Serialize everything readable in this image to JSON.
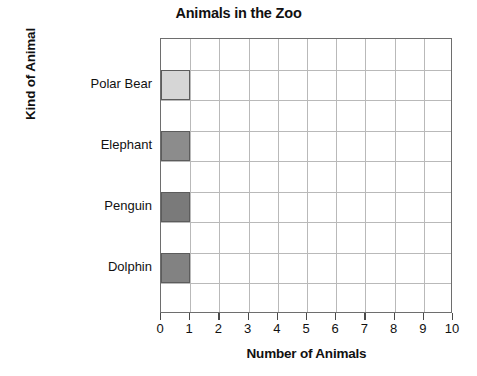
{
  "chart_data": {
    "type": "bar",
    "orientation": "horizontal",
    "title": "Animals in the Zoo",
    "xlabel": "Number of Animals",
    "ylabel": "Kind of Animal",
    "categories": [
      "Polar Bear",
      "Elephant",
      "Penguin",
      "Dolphin"
    ],
    "values": [
      1,
      1,
      1,
      1
    ],
    "bar_colors": [
      "#d6d6d6",
      "#8c8c8c",
      "#7a7a7a",
      "#828282"
    ],
    "bar_border_color": "#5c5c5c",
    "xlim": [
      0,
      10
    ],
    "xticks": [
      0,
      1,
      2,
      3,
      4,
      5,
      6,
      7,
      8,
      9,
      10
    ],
    "xtick_labels": [
      "0",
      "1",
      "2",
      "3",
      "4",
      "5",
      "6",
      "7",
      "8",
      "9",
      "10"
    ],
    "grid": true,
    "grid_color": "#b9b9b9",
    "axis_color": "#6e6e6e",
    "background": "#ffffff",
    "legend": null,
    "series": [
      {
        "name": "Animals in the Zoo",
        "points": [
          {
            "category": "Polar Bear",
            "value": 1,
            "color": "#d6d6d6"
          },
          {
            "category": "Elephant",
            "value": 1,
            "color": "#8c8c8c"
          },
          {
            "category": "Penguin",
            "value": 1,
            "color": "#7a7a7a"
          },
          {
            "category": "Dolphin",
            "value": 1,
            "color": "#828282"
          }
        ]
      }
    ]
  }
}
